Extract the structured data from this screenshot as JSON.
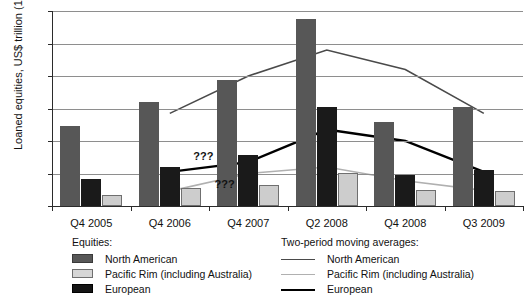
{
  "chart_data": {
    "type": "bar",
    "title": "",
    "xlabel": "",
    "ylabel": "Loaned equities, US$ trillion (10",
    "ylabel_sup": "12",
    "ylabel_suffix": ")",
    "categories": [
      "Q4 2005",
      "Q4 2006",
      "Q4 2007",
      "Q2 2008",
      "Q4 2008",
      "Q3 2009"
    ],
    "ylim": [
      0,
      0.6
    ],
    "yticks": [
      "0",
      "0.1",
      "0.2",
      "0.3",
      "0.4",
      "0.5",
      "0.6"
    ],
    "ytick_values": [
      0,
      0.1,
      0.2,
      0.3,
      0.4,
      0.5,
      0.6
    ],
    "grid": true,
    "legend_position": "bottom",
    "series": [
      {
        "name": "North American",
        "type": "bar",
        "color": "#575757",
        "values": [
          0.245,
          0.32,
          0.387,
          0.575,
          0.26,
          0.305
        ]
      },
      {
        "name": "European",
        "type": "bar",
        "color": "#1a1a1a",
        "values": [
          0.082,
          0.12,
          0.156,
          0.305,
          0.096,
          0.11
        ]
      },
      {
        "name": "Pacific Rim (including Australia)",
        "type": "bar",
        "color": "#cdcdcd",
        "values": [
          0.035,
          0.056,
          0.065,
          0.101,
          0.05,
          0.046
        ]
      },
      {
        "name": "North American",
        "type": "line",
        "color": "#4a4a4a",
        "values": [
          null,
          0.285,
          0.4,
          0.48,
          0.42,
          0.285
        ]
      },
      {
        "name": "European",
        "type": "line",
        "color": "#000000",
        "values": [
          null,
          0.105,
          0.135,
          0.235,
          0.2,
          0.105
        ]
      },
      {
        "name": "Pacific Rim (including Australia)",
        "type": "line",
        "color": "#b0b0b0",
        "values": [
          null,
          0.046,
          0.1,
          0.12,
          0.078,
          0.048
        ]
      }
    ],
    "annotations": [
      {
        "text": "???",
        "x": 0.3,
        "y": 0.148
      },
      {
        "text": "???",
        "x": 0.345,
        "y": 0.062
      }
    ]
  },
  "legend_bars": {
    "title": "Equities:",
    "items": [
      {
        "label": "North American",
        "swatch": "swatch-north-american"
      },
      {
        "label": "Pacific Rim (including Australia)",
        "swatch": "swatch-pacific-rim"
      },
      {
        "label": "European",
        "swatch": "swatch-european"
      }
    ]
  },
  "legend_lines": {
    "title": "Two-period moving averages:",
    "items": [
      {
        "label": "North American",
        "swatch": "line-north-american"
      },
      {
        "label": "Pacific Rim (including Australia)",
        "swatch": "line-pacific-rim"
      },
      {
        "label": "European",
        "swatch": "line-european"
      }
    ]
  }
}
